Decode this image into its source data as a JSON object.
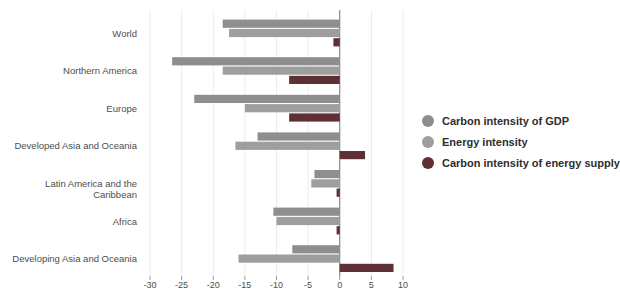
{
  "chart_data": {
    "type": "bar",
    "orientation": "horizontal",
    "title": "",
    "xlabel": "",
    "ylabel": "",
    "categories": [
      "World",
      "Northern America",
      "Europe",
      "Developed Asia and Oceania",
      "Latin America and the Caribbean",
      "Africa",
      "Developing Asia and Oceania"
    ],
    "series": [
      {
        "name": "Carbon intensity of GDP",
        "color": "#8e8e8e",
        "values": [
          -18.5,
          -26.5,
          -23,
          -13,
          -4,
          -10.5,
          -7.5
        ]
      },
      {
        "name": "Energy intensity",
        "color": "#9e9e9e",
        "values": [
          -17.5,
          -18.5,
          -15,
          -16.5,
          -4.5,
          -10,
          -16
        ]
      },
      {
        "name": "Carbon intensity of energy supply",
        "color": "#5d3036",
        "values": [
          -1,
          -8,
          -8,
          4,
          -0.5,
          -0.5,
          8.5
        ]
      }
    ],
    "xlim": [
      -30,
      10
    ],
    "xticks": [
      -30,
      -25,
      -20,
      -15,
      -10,
      -5,
      0,
      5,
      10
    ],
    "grid": "faint vertical gridlines",
    "legend_position": "right"
  },
  "colors": {
    "background": "#ffffff",
    "zero_line": "#707070",
    "gridline": "#ececec",
    "tick": "#9a9a9a",
    "tick_label": "#4d4d4d"
  }
}
